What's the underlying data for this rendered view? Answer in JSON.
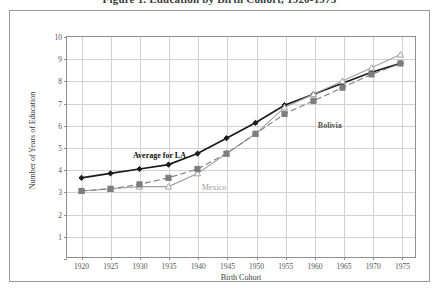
{
  "figure": {
    "title": "Figure 1. Education by Birth Cohort, 1920-1975"
  },
  "chart_data": {
    "type": "line",
    "title": "Figure 1. Education by Birth Cohort, 1920-1975",
    "xlabel": "Birth Cohort",
    "ylabel": "Number of Years of Education",
    "xlim": [
      1917.5,
      1977.5
    ],
    "ylim": [
      0,
      10
    ],
    "xticks": [
      1920,
      1925,
      1930,
      1935,
      1940,
      1945,
      1950,
      1955,
      1960,
      1965,
      1970,
      1975
    ],
    "yticks": [
      0,
      1,
      2,
      3,
      4,
      5,
      6,
      7,
      8,
      9,
      10
    ],
    "grid": true,
    "legend": "in-plot annotations",
    "x": [
      1920,
      1925,
      1930,
      1935,
      1940,
      1945,
      1950,
      1955,
      1960,
      1965,
      1970,
      1975
    ],
    "series": [
      {
        "name": "Average for LA",
        "marker": "diamond",
        "line": "solid",
        "color": "#1a1a1a",
        "values": [
          3.6,
          3.8,
          4.0,
          4.2,
          4.7,
          5.4,
          6.1,
          6.9,
          7.4,
          7.9,
          8.4,
          8.8
        ]
      },
      {
        "name": "Mexico",
        "marker": "triangle",
        "line": "solid",
        "color": "#a0a0a0",
        "values": [
          3.0,
          3.1,
          3.2,
          3.2,
          3.8,
          4.7,
          5.6,
          6.8,
          7.4,
          8.0,
          8.6,
          9.2
        ]
      },
      {
        "name": "Bolivia",
        "marker": "square",
        "line": "dashed",
        "color": "#7d7d7d",
        "values": [
          3.0,
          3.1,
          3.3,
          3.6,
          4.0,
          4.7,
          5.6,
          6.5,
          7.1,
          7.7,
          8.3,
          8.8
        ]
      }
    ],
    "annotations": [
      {
        "text": "Average for LA",
        "x": 1928.8,
        "y": 4.85,
        "style": "la"
      },
      {
        "text": "Mexico",
        "x": 1940.6,
        "y": 3.42,
        "style": "mexico"
      },
      {
        "text": "Bolivia",
        "x": 1960.5,
        "y": 6.22,
        "style": "bolivia"
      }
    ]
  }
}
